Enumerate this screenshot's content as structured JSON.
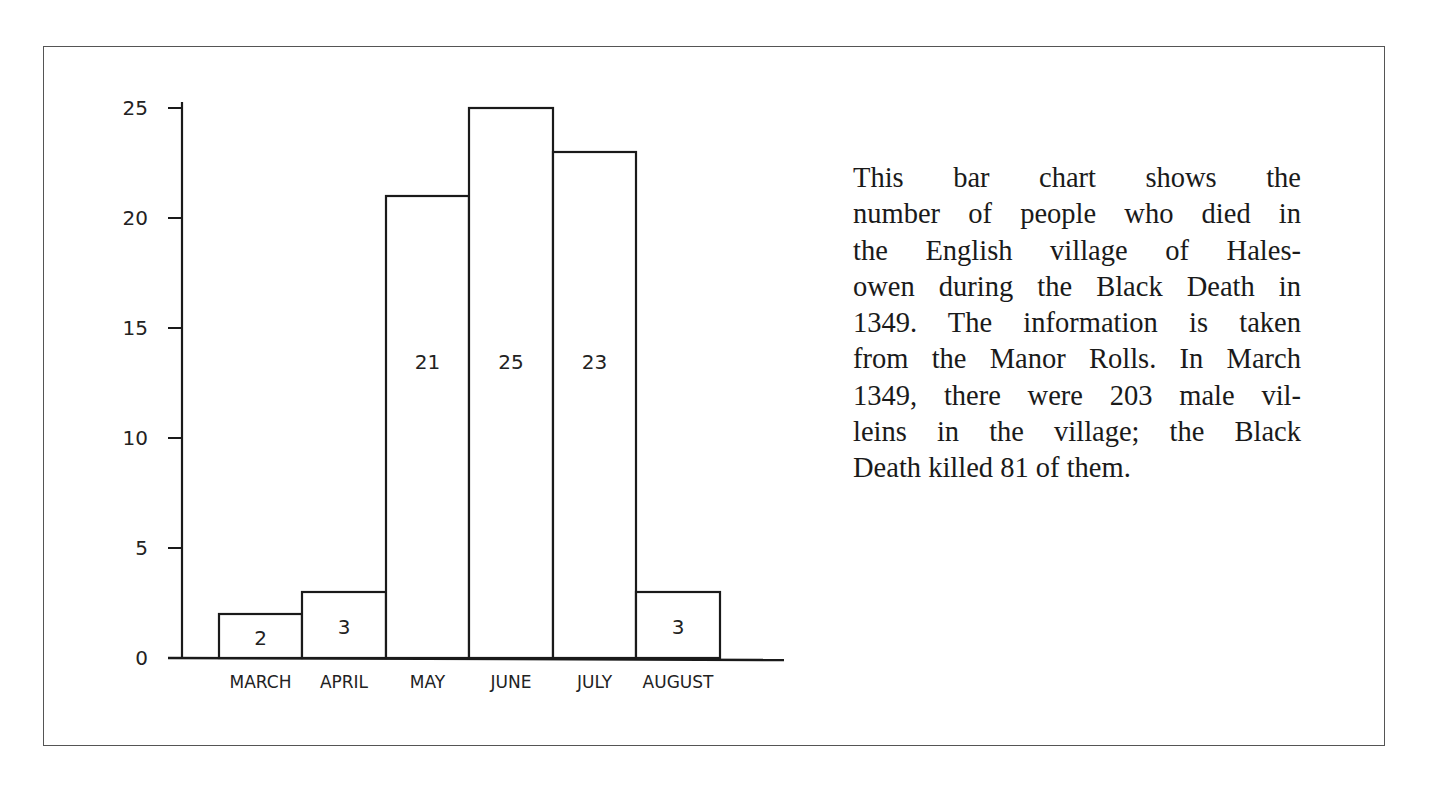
{
  "chart_data": {
    "type": "bar",
    "title": "",
    "xlabel": "",
    "ylabel": "",
    "categories": [
      "MARCH",
      "APRIL",
      "MAY",
      "JUNE",
      "JULY",
      "AUGUST"
    ],
    "values": [
      2,
      3,
      21,
      25,
      23,
      3
    ],
    "bar_labels": [
      "2",
      "3",
      "21",
      "25",
      "23",
      "3"
    ],
    "yticks": [
      0,
      5,
      10,
      15,
      20,
      25
    ],
    "ytick_labels": [
      "0",
      "5",
      "10",
      "15",
      "20",
      "25"
    ],
    "ylim": [
      0,
      25
    ],
    "grid": false,
    "legend": null,
    "bar_fill": "#ffffff",
    "bar_stroke": "#1a1a1a"
  },
  "description": {
    "lines": [
      "This bar chart shows the",
      "number of people who died in",
      "the English village of Hales-",
      "owen during the Black Death in",
      "1349. The information is taken",
      "from the Manor Rolls. In March",
      "1349, there were 203 male vil-",
      "leins in the village; the Black",
      "Death killed 81 of them."
    ]
  }
}
